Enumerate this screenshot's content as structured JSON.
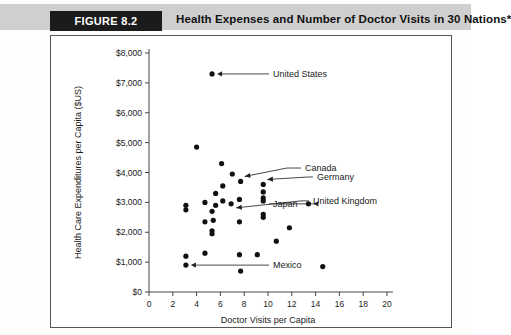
{
  "header": {
    "figure_badge": "FIGURE 8.2",
    "title": "Health Expenses and Number of Doctor Visits in 30 Nations*"
  },
  "chart_data": {
    "type": "scatter",
    "title": "Health Expenses and Number of Doctor Visits in 30 Nations*",
    "xlabel": "Doctor Visits per Capita",
    "ylabel": "Health Care Expenditures per Capita ($US)",
    "xlim": [
      0,
      20
    ],
    "ylim": [
      0,
      8000
    ],
    "xticks": [
      0,
      2,
      4,
      6,
      8,
      10,
      12,
      14,
      16,
      18,
      20
    ],
    "xticklabels": [
      "0",
      "2",
      "4",
      "6",
      "8",
      "10",
      "12",
      "14",
      "16",
      "18",
      "20"
    ],
    "yticks": [
      0,
      1000,
      2000,
      3000,
      4000,
      5000,
      6000,
      7000,
      8000
    ],
    "yticklabels": [
      "$0",
      "$1,000",
      "$2,000",
      "$3,000",
      "$4,000",
      "$5,000",
      "$6,000",
      "$7,000",
      "$8,000"
    ],
    "grid": false,
    "legend": null,
    "marker_color": "#111111",
    "points": [
      {
        "x": 5.3,
        "y": 7300,
        "label": "United States"
      },
      {
        "x": 4.0,
        "y": 4850,
        "label": null
      },
      {
        "x": 6.1,
        "y": 4300,
        "label": null
      },
      {
        "x": 7.0,
        "y": 3950,
        "label": null
      },
      {
        "x": 7.7,
        "y": 3700,
        "label": "Canada"
      },
      {
        "x": 9.6,
        "y": 3600,
        "label": "Germany"
      },
      {
        "x": 6.2,
        "y": 3550,
        "label": null
      },
      {
        "x": 9.6,
        "y": 3350,
        "label": null
      },
      {
        "x": 5.6,
        "y": 3300,
        "label": null
      },
      {
        "x": 9.6,
        "y": 3150,
        "label": null
      },
      {
        "x": 9.6,
        "y": 3050,
        "label": null
      },
      {
        "x": 6.2,
        "y": 3050,
        "label": null
      },
      {
        "x": 7.6,
        "y": 3100,
        "label": null
      },
      {
        "x": 4.7,
        "y": 3000,
        "label": null
      },
      {
        "x": 6.9,
        "y": 2950,
        "label": "United Kingdom"
      },
      {
        "x": 3.1,
        "y": 2900,
        "label": null
      },
      {
        "x": 5.6,
        "y": 2900,
        "label": null
      },
      {
        "x": 13.4,
        "y": 2950,
        "label": "Japan"
      },
      {
        "x": 3.1,
        "y": 2750,
        "label": null
      },
      {
        "x": 5.3,
        "y": 2700,
        "label": null
      },
      {
        "x": 9.6,
        "y": 2600,
        "label": null
      },
      {
        "x": 9.6,
        "y": 2500,
        "label": null
      },
      {
        "x": 5.4,
        "y": 2400,
        "label": null
      },
      {
        "x": 4.7,
        "y": 2350,
        "label": null
      },
      {
        "x": 7.6,
        "y": 2350,
        "label": null
      },
      {
        "x": 11.8,
        "y": 2150,
        "label": null
      },
      {
        "x": 5.3,
        "y": 2050,
        "label": null
      },
      {
        "x": 5.3,
        "y": 1950,
        "label": null
      },
      {
        "x": 10.7,
        "y": 1700,
        "label": null
      },
      {
        "x": 4.7,
        "y": 1300,
        "label": null
      },
      {
        "x": 7.6,
        "y": 1250,
        "label": null
      },
      {
        "x": 9.1,
        "y": 1250,
        "label": null
      },
      {
        "x": 3.1,
        "y": 1200,
        "label": null
      },
      {
        "x": 3.1,
        "y": 900,
        "label": "Mexico"
      },
      {
        "x": 14.6,
        "y": 850,
        "label": null
      },
      {
        "x": 7.7,
        "y": 700,
        "label": null
      }
    ],
    "annotations": [
      {
        "text": "United States",
        "point_x": 5.3,
        "point_y": 7300
      },
      {
        "text": "Canada",
        "point_x": 7.7,
        "point_y": 3700
      },
      {
        "text": "Germany",
        "point_x": 9.6,
        "point_y": 3600
      },
      {
        "text": "United Kingdom",
        "point_x": 6.9,
        "point_y": 2950
      },
      {
        "text": "Japan",
        "point_x": 13.4,
        "point_y": 2950
      },
      {
        "text": "Mexico",
        "point_x": 3.1,
        "point_y": 900
      }
    ]
  }
}
